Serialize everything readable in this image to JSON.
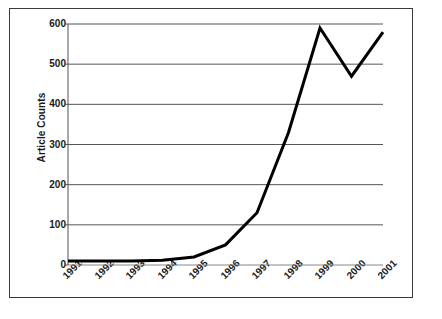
{
  "chart_data": {
    "type": "line",
    "title": "",
    "xlabel": "",
    "ylabel": "Article Counts",
    "categories": [
      "1991",
      "1992",
      "1993",
      "1994",
      "1995",
      "1996",
      "1997",
      "1998",
      "1999",
      "2000",
      "2001"
    ],
    "values": [
      10,
      10,
      10,
      12,
      20,
      50,
      130,
      330,
      590,
      470,
      580
    ],
    "series": [
      {
        "name": "Article Counts",
        "values": [
          10,
          10,
          10,
          12,
          20,
          50,
          130,
          330,
          590,
          470,
          580
        ]
      }
    ],
    "ylim": [
      0,
      600
    ],
    "y_ticks": [
      0,
      100,
      200,
      300,
      400,
      500,
      600
    ],
    "y_tick_labels": [
      "0",
      "100",
      "200",
      "300",
      "400",
      "500",
      "600"
    ],
    "grid": true,
    "grid_axis": "y",
    "legend": false,
    "legend_position": "none",
    "line_color": "#000000",
    "line_width": 3,
    "grid_color": "#555555",
    "axis_color": "#555555",
    "background": "#ffffff",
    "border_color": "#3a3a3a"
  }
}
